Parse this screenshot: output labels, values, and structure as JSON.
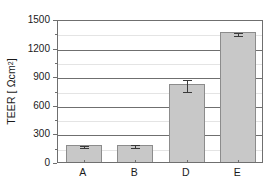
{
  "chart_data": {
    "type": "bar",
    "title": "",
    "xlabel": "",
    "ylabel": "TEER [ Ωcm2 ]",
    "ylabel_parts": {
      "prefix": "TEER [ Ωcm",
      "exponent": "2",
      "suffix": "]"
    },
    "categories": [
      "A",
      "B",
      "D",
      "E"
    ],
    "values": [
      178,
      183,
      820,
      1360
    ],
    "errors": [
      10,
      12,
      60,
      18
    ],
    "ylim": [
      0,
      1500
    ],
    "yticks": [
      0,
      300,
      600,
      900,
      1200,
      1500
    ],
    "ytick_labels": [
      "0",
      "300",
      "600",
      "900",
      "1200",
      "1500"
    ],
    "yminor_ticks": [
      150,
      450,
      750,
      1050,
      1350
    ],
    "grid": true,
    "grid_axis": "y",
    "legend": null,
    "bar_color": "#c8c8c8",
    "bar_edge_color": "#8c8c8c",
    "error_color": "#3a3a3a",
    "axis_color": "#6f6f6f",
    "text_color": "#1a1a1a",
    "background": "#ffffff"
  }
}
